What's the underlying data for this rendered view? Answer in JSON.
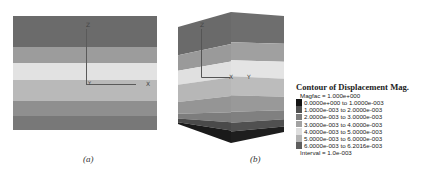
{
  "figure": {
    "panel_a": {
      "caption": "(a)",
      "bands": [
        {
          "top": 0,
          "height": 31,
          "color": "#6b6b6b"
        },
        {
          "top": 31,
          "height": 16,
          "color": "#9c9c9c"
        },
        {
          "top": 47,
          "height": 17,
          "color": "#e2e2e2"
        },
        {
          "top": 64,
          "height": 21,
          "color": "#b9b9b9"
        },
        {
          "top": 85,
          "height": 15,
          "color": "#8f8f8f"
        },
        {
          "top": 100,
          "height": 14,
          "color": "#787878"
        }
      ],
      "axes": {
        "z_label": "Z",
        "x_label": "X",
        "y_label": "Y"
      }
    },
    "panel_b": {
      "caption": "(b)",
      "axes": {
        "z_label": "Z",
        "x_label": "X",
        "y_label": "Y"
      }
    }
  },
  "legend": {
    "title": "Contour of Displacement Mag.",
    "magfac": "Magfac = 1.000e+000",
    "rows": [
      {
        "label": "0.0000e+000 to 1.0000e-003",
        "color": "#141414"
      },
      {
        "label": "1.0000e-003 to 2.0000e-003",
        "color": "#505050"
      },
      {
        "label": "2.0000e-003 to 3.0000e-003",
        "color": "#7c7c7c"
      },
      {
        "label": "3.0000e-003 to 4.0000e-003",
        "color": "#a2a2a2"
      },
      {
        "label": "4.0000e-003 to 5.0000e-003",
        "color": "#dedede"
      },
      {
        "label": "5.0000e-003 to 6.0000e-003",
        "color": "#b4b4b4"
      },
      {
        "label": "6.0000e-003 to 6.2016e-003",
        "color": "#5e5e5e"
      }
    ],
    "interval": "Interval = 1.0e-003"
  }
}
